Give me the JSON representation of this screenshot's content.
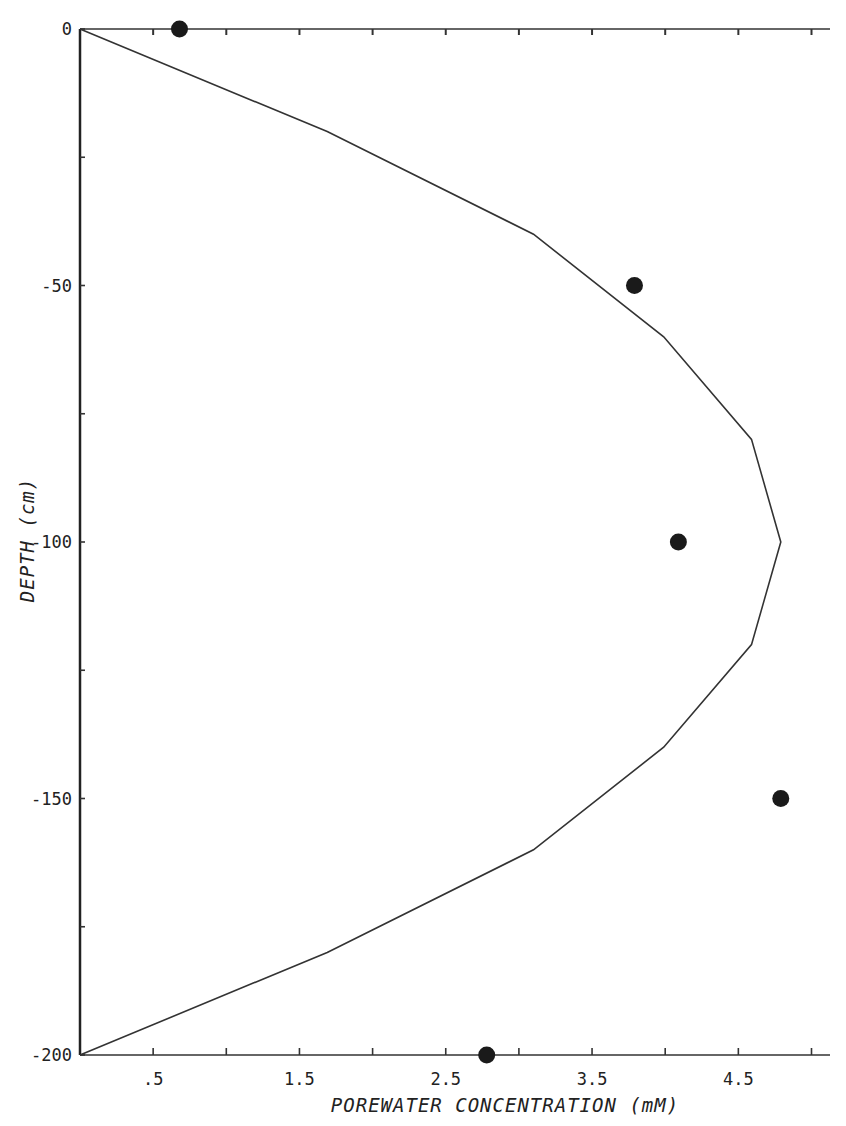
{
  "chart_data": {
    "type": "line",
    "title": "",
    "xlabel": "POREWATER CONCENTRATION (mM)",
    "ylabel": "DEPTH (cm)",
    "xlim": [
      0,
      5.2
    ],
    "ylim": [
      -200,
      0
    ],
    "x_ticks": [
      0.5,
      1.0,
      1.5,
      2.0,
      2.5,
      3.0,
      3.5,
      4.0,
      4.5,
      5.0
    ],
    "x_tick_labels": [
      ".5",
      "",
      "1.5",
      "",
      "2.5",
      "",
      "3.5",
      "",
      "4.5",
      ""
    ],
    "y_ticks": [
      0,
      -25,
      -50,
      -75,
      -100,
      -125,
      -150,
      -175,
      -200
    ],
    "y_tick_labels": [
      "0",
      "",
      "-50",
      "",
      "-100",
      "",
      "-150",
      "",
      "-200"
    ],
    "grid": false,
    "legend": null,
    "series": [
      {
        "name": "model profile",
        "type": "line",
        "color": "#333333",
        "x": [
          0.0,
          1.69,
          3.1,
          3.99,
          4.59,
          4.79,
          4.59,
          3.99,
          3.1,
          1.69,
          0.0
        ],
        "y": [
          0,
          -20,
          -40,
          -60,
          -80,
          -100,
          -120,
          -140,
          -160,
          -180,
          -200
        ]
      },
      {
        "name": "measured",
        "type": "scatter",
        "color": "#1a1a1a",
        "x": [
          0.68,
          3.79,
          4.09,
          4.79,
          2.78
        ],
        "y": [
          0,
          -50,
          -100,
          -150,
          -200
        ]
      }
    ]
  },
  "labels": {
    "x_axis_title": "POREWATER CONCENTRATION (mM)",
    "y_axis_title": "DEPTH (cm)"
  }
}
